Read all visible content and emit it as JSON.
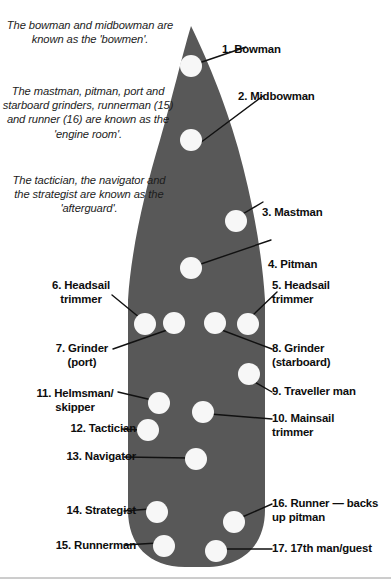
{
  "diagram": {
    "hull_color": "#585858",
    "crew_dot_color": "#f7f7f7",
    "leader_color": "#111111",
    "background": "#ffffff"
  },
  "notes": [
    {
      "id": "bowmen",
      "text": "The bowman and midbowman are known as the 'bowmen'."
    },
    {
      "id": "engine-room",
      "text": "The mastman, pitman, port and starboard grinders, runnerman (15) and runner (16) are known as the 'engine room'."
    },
    {
      "id": "afterguard",
      "text": "The tactician, the navigator and the strategist are known as the 'afterguard'."
    }
  ],
  "crew": [
    {
      "number": "1.",
      "name": "Bowman",
      "label": "1. Bowman",
      "side": "right",
      "dot": {
        "cx": 191,
        "cy": 66,
        "r": 11
      }
    },
    {
      "number": "2.",
      "name": "Midbowman",
      "label": "2. Midbowman",
      "side": "right",
      "dot": {
        "cx": 191,
        "cy": 140,
        "r": 11
      }
    },
    {
      "number": "3.",
      "name": "Mastman",
      "label": "3. Mastman",
      "side": "right",
      "dot": {
        "cx": 236,
        "cy": 221,
        "r": 11
      }
    },
    {
      "number": "4.",
      "name": "Pitman",
      "label": "4. Pitman",
      "side": "right",
      "dot": {
        "cx": 191,
        "cy": 268,
        "r": 11
      }
    },
    {
      "number": "5.",
      "name": "Headsail trimmer",
      "label": "5. Headsail\ntrimmer",
      "side": "right",
      "dot": {
        "cx": 248,
        "cy": 324,
        "r": 11
      }
    },
    {
      "number": "6.",
      "name": "Headsail trimmer",
      "label": "6. Headsail\ntrimmer",
      "side": "left",
      "dot": {
        "cx": 145,
        "cy": 324,
        "r": 11
      }
    },
    {
      "number": "7.",
      "name": "Grinder (port)",
      "label": "7. Grinder\n(port)",
      "side": "left",
      "dot": {
        "cx": 174,
        "cy": 323,
        "r": 11
      }
    },
    {
      "number": "8.",
      "name": "Grinder (starboard)",
      "label": "8. Grinder\n(starboard)",
      "side": "right",
      "dot": {
        "cx": 215,
        "cy": 323,
        "r": 11
      }
    },
    {
      "number": "9.",
      "name": "Traveller man",
      "label": "9. Traveller man",
      "side": "right",
      "dot": {
        "cx": 249,
        "cy": 374,
        "r": 11
      }
    },
    {
      "number": "10.",
      "name": "Mainsail trimmer",
      "label": "10. Mainsail\ntrimmer",
      "side": "right",
      "dot": {
        "cx": 203,
        "cy": 412,
        "r": 11
      }
    },
    {
      "number": "11.",
      "name": "Helmsman/skipper",
      "label": "11. Helmsman/\nskipper",
      "side": "left",
      "dot": {
        "cx": 159,
        "cy": 403,
        "r": 11
      }
    },
    {
      "number": "12.",
      "name": "Tactician",
      "label": "12. Tactician",
      "side": "left",
      "dot": {
        "cx": 148,
        "cy": 430,
        "r": 11
      }
    },
    {
      "number": "13.",
      "name": "Navigator",
      "label": "13. Navigator",
      "side": "left",
      "dot": {
        "cx": 196,
        "cy": 459,
        "r": 11
      }
    },
    {
      "number": "14.",
      "name": "Strategist",
      "label": "14. Strategist",
      "side": "left",
      "dot": {
        "cx": 157,
        "cy": 512,
        "r": 11
      }
    },
    {
      "number": "15.",
      "name": "Runnerman",
      "label": "15. Runnerman",
      "side": "left",
      "dot": {
        "cx": 164,
        "cy": 546,
        "r": 11
      }
    },
    {
      "number": "16.",
      "name": "Runner — backs up pitman",
      "label": "16. Runner — backs\nup pitman",
      "side": "right",
      "dot": {
        "cx": 234,
        "cy": 522,
        "r": 11
      }
    },
    {
      "number": "17.",
      "name": "17th man/guest",
      "label": "17. 17th man/guest",
      "side": "right",
      "dot": {
        "cx": 216,
        "cy": 551,
        "r": 11
      }
    }
  ]
}
